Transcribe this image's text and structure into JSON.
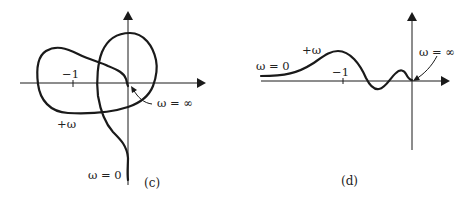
{
  "panels": [
    {
      "id": "c",
      "caption": "(c)",
      "tick_label": "−1",
      "labels": {
        "plus_omega": "+ω",
        "omega_inf": "ω = ∞",
        "omega_zero": "ω = 0"
      }
    },
    {
      "id": "d",
      "caption": "(d)",
      "tick_label": "−1",
      "labels": {
        "plus_omega": "+ω",
        "omega_inf": "ω = ∞",
        "omega_zero": "ω = 0"
      }
    }
  ],
  "colors": {
    "stroke": "#1a1a1a",
    "background": "#ffffff"
  }
}
